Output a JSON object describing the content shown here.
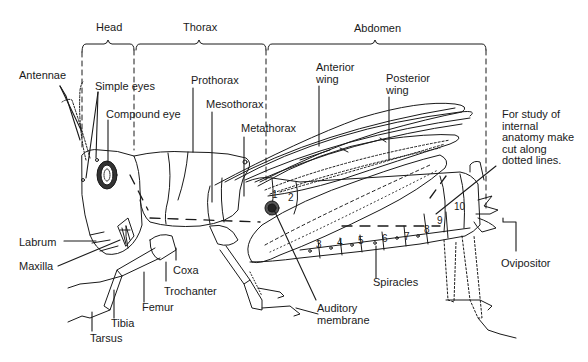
{
  "diagram": {
    "type": "labeled-anatomy",
    "regions": [
      {
        "id": "head",
        "label": "Head"
      },
      {
        "id": "thorax",
        "label": "Thorax"
      },
      {
        "id": "abdomen",
        "label": "Abdomen"
      }
    ],
    "labels": {
      "antennae": "Antennae",
      "simple_eyes": "Simple eyes",
      "compound_eye": "Compound eye",
      "prothorax": "Prothorax",
      "mesothorax": "Mesothorax",
      "metathorax": "Metathorax",
      "anterior_wing": "Anterior\nwing",
      "posterior_wing": "Posterior\nwing",
      "note": "For study of\ninternal\nanatomy make\ncut along\ndotted lines.",
      "labrum": "Labrum",
      "maxilla": "Maxilla",
      "coxa": "Coxa",
      "trochanter": "Trochanter",
      "femur": "Femur",
      "tibia": "Tibia",
      "tarsus": "Tarsus",
      "auditory_membrane": "Auditory\nmembrane",
      "spiracles": "Spiracles",
      "ovipositor": "Ovipositor"
    },
    "abdominal_segments": [
      "1",
      "2",
      "3",
      "4",
      "5",
      "6",
      "7",
      "8",
      "9",
      "10"
    ],
    "colors": {
      "ink": "#1a1a1a",
      "background": "#ffffff"
    }
  }
}
